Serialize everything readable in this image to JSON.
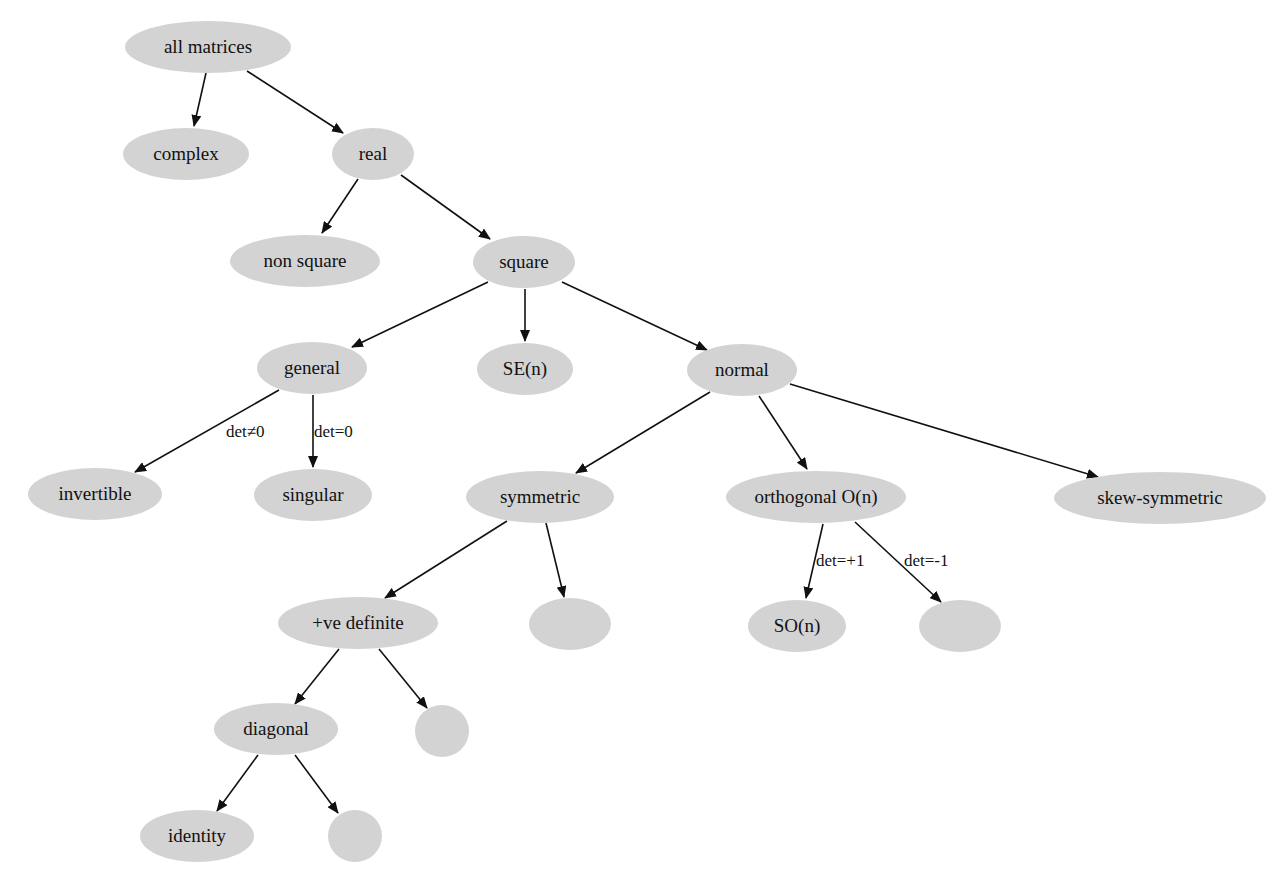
{
  "diagram": {
    "type": "tree",
    "colors": {
      "node_fill": "#d3d3d3",
      "edge": "#111111",
      "background": "#ffffff",
      "text": "#111111"
    },
    "nodes": [
      {
        "id": "all_matrices",
        "label": "all matrices",
        "cx": 208,
        "cy": 47,
        "rx": 83,
        "ry": 26
      },
      {
        "id": "complex",
        "label": "complex",
        "cx": 186,
        "cy": 154,
        "rx": 63,
        "ry": 26
      },
      {
        "id": "real",
        "label": "real",
        "cx": 373,
        "cy": 154,
        "rx": 41,
        "ry": 26
      },
      {
        "id": "non_square",
        "label": "non square",
        "cx": 305,
        "cy": 261,
        "rx": 75,
        "ry": 26
      },
      {
        "id": "square",
        "label": "square",
        "cx": 524,
        "cy": 262,
        "rx": 51,
        "ry": 26
      },
      {
        "id": "general",
        "label": "general",
        "cx": 312,
        "cy": 368,
        "rx": 55,
        "ry": 26
      },
      {
        "id": "se_n",
        "label": "SE(n)",
        "cx": 525,
        "cy": 369,
        "rx": 48,
        "ry": 26
      },
      {
        "id": "normal",
        "label": "normal",
        "cx": 742,
        "cy": 370,
        "rx": 55,
        "ry": 26
      },
      {
        "id": "invertible",
        "label": "invertible",
        "cx": 95,
        "cy": 494,
        "rx": 67,
        "ry": 26
      },
      {
        "id": "singular",
        "label": "singular",
        "cx": 313,
        "cy": 495,
        "rx": 59,
        "ry": 26
      },
      {
        "id": "symmetric",
        "label": "symmetric",
        "cx": 540,
        "cy": 497,
        "rx": 74,
        "ry": 26
      },
      {
        "id": "orthogonal",
        "label": "orthogonal O(n)",
        "cx": 816,
        "cy": 497,
        "rx": 90,
        "ry": 26
      },
      {
        "id": "skew_symmetric",
        "label": "skew-symmetric",
        "cx": 1160,
        "cy": 498,
        "rx": 106,
        "ry": 26
      },
      {
        "id": "pos_definite",
        "label": "+ve definite",
        "cx": 358,
        "cy": 623,
        "rx": 80,
        "ry": 26
      },
      {
        "id": "sym_other",
        "label": "",
        "cx": 570,
        "cy": 624,
        "rx": 41,
        "ry": 26
      },
      {
        "id": "so_n",
        "label": "SO(n)",
        "cx": 797,
        "cy": 626,
        "rx": 49,
        "ry": 26
      },
      {
        "id": "det_neg_one",
        "label": "",
        "cx": 960,
        "cy": 626,
        "rx": 41,
        "ry": 26
      },
      {
        "id": "diagonal",
        "label": "diagonal",
        "cx": 276,
        "cy": 729,
        "rx": 62,
        "ry": 26
      },
      {
        "id": "pd_other",
        "label": "",
        "cx": 442,
        "cy": 731,
        "rx": 27,
        "ry": 26
      },
      {
        "id": "identity",
        "label": "identity",
        "cx": 197,
        "cy": 836,
        "rx": 57,
        "ry": 26
      },
      {
        "id": "diag_other",
        "label": "",
        "cx": 355,
        "cy": 836,
        "rx": 27,
        "ry": 26
      }
    ],
    "edges": [
      {
        "from": "all_matrices",
        "to": "complex",
        "label": "",
        "x1": 206,
        "y1": 73,
        "x2": 194,
        "y2": 126
      },
      {
        "from": "all_matrices",
        "to": "real",
        "label": "",
        "x1": 247,
        "y1": 71,
        "x2": 343,
        "y2": 133
      },
      {
        "from": "real",
        "to": "non_square",
        "label": "",
        "x1": 358,
        "y1": 179,
        "x2": 322,
        "y2": 233
      },
      {
        "from": "real",
        "to": "square",
        "label": "",
        "x1": 401,
        "y1": 175,
        "x2": 490,
        "y2": 239
      },
      {
        "from": "square",
        "to": "general",
        "label": "",
        "x1": 488,
        "y1": 282,
        "x2": 352,
        "y2": 347
      },
      {
        "from": "square",
        "to": "se_n",
        "label": "",
        "x1": 525,
        "y1": 289,
        "x2": 525,
        "y2": 341
      },
      {
        "from": "square",
        "to": "normal",
        "label": "",
        "x1": 562,
        "y1": 282,
        "x2": 707,
        "y2": 350
      },
      {
        "from": "general",
        "to": "invertible",
        "label": "det≠0",
        "x1": 279,
        "y1": 390,
        "x2": 135,
        "y2": 472,
        "lx": 226,
        "ly": 437
      },
      {
        "from": "general",
        "to": "singular",
        "label": "det=0",
        "x1": 313,
        "y1": 395,
        "x2": 313,
        "y2": 467,
        "lx": 314,
        "ly": 437
      },
      {
        "from": "normal",
        "to": "symmetric",
        "label": "",
        "x1": 710,
        "y1": 392,
        "x2": 576,
        "y2": 473
      },
      {
        "from": "normal",
        "to": "orthogonal",
        "label": "",
        "x1": 759,
        "y1": 396,
        "x2": 807,
        "y2": 469
      },
      {
        "from": "normal",
        "to": "skew_symmetric",
        "label": "",
        "x1": 790,
        "y1": 384,
        "x2": 1098,
        "y2": 477
      },
      {
        "from": "symmetric",
        "to": "pos_definite",
        "label": "",
        "x1": 507,
        "y1": 521,
        "x2": 385,
        "y2": 598
      },
      {
        "from": "symmetric",
        "to": "sym_other",
        "label": "",
        "x1": 546,
        "y1": 523,
        "x2": 564,
        "y2": 597
      },
      {
        "from": "orthogonal",
        "to": "so_n",
        "label": "det=+1",
        "x1": 823,
        "y1": 524,
        "x2": 806,
        "y2": 598,
        "lx": 816,
        "ly": 566
      },
      {
        "from": "orthogonal",
        "to": "det_neg_one",
        "label": "det=-1",
        "x1": 855,
        "y1": 522,
        "x2": 941,
        "y2": 602,
        "lx": 904,
        "ly": 566
      },
      {
        "from": "pos_definite",
        "to": "diagonal",
        "label": "",
        "x1": 339,
        "y1": 649,
        "x2": 295,
        "y2": 704
      },
      {
        "from": "pos_definite",
        "to": "pd_other",
        "label": "",
        "x1": 379,
        "y1": 649,
        "x2": 427,
        "y2": 708
      },
      {
        "from": "diagonal",
        "to": "identity",
        "label": "",
        "x1": 258,
        "y1": 755,
        "x2": 217,
        "y2": 811
      },
      {
        "from": "diagonal",
        "to": "diag_other",
        "label": "",
        "x1": 295,
        "y1": 755,
        "x2": 338,
        "y2": 813
      }
    ]
  }
}
